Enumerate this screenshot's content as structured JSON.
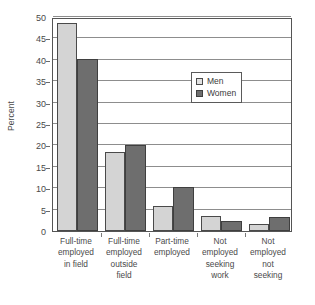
{
  "chart_data": {
    "type": "bar",
    "title": "",
    "subtitle": "",
    "xlabel": "",
    "ylabel": "Percent",
    "ylim": [
      0,
      50
    ],
    "ytick_step": 5,
    "yticks": [
      0,
      5,
      10,
      15,
      20,
      25,
      30,
      35,
      40,
      45,
      50
    ],
    "ytick_labels": [
      "0",
      "5",
      "10",
      "15",
      "20",
      "25",
      "30",
      "35",
      "40",
      "45",
      "50"
    ],
    "grid": true,
    "grid_axis": "y",
    "legend_position": "center-right-inside",
    "categories": [
      "Full-time employed in field",
      "Full-time employed outside field",
      "Part-time employed",
      "Not employed seeking work",
      "Not employed not seeking"
    ],
    "category_lines": [
      [
        "Full-time",
        "employed",
        "in field"
      ],
      [
        "Full-time",
        "employed",
        "outside",
        "field"
      ],
      [
        "Part-time",
        "employed"
      ],
      [
        "Not",
        "employed",
        "seeking",
        "work"
      ],
      [
        "Not",
        "employed",
        "not",
        "seeking"
      ]
    ],
    "series": [
      {
        "name": "Men",
        "color": "#d4d4d4",
        "values": [
          48.7,
          18.5,
          5.8,
          3.5,
          1.7
        ]
      },
      {
        "name": "Women",
        "color": "#6e6e6e",
        "values": [
          40.2,
          20.0,
          10.2,
          2.4,
          3.3
        ]
      }
    ],
    "annotations": []
  },
  "legend": {
    "entries": [
      {
        "label": "Men",
        "swatch": "light-gray-square"
      },
      {
        "label": "Women",
        "swatch": "dark-gray-square"
      }
    ]
  },
  "colors": {
    "men_bar": "#d4d4d4",
    "women_bar": "#6e6e6e",
    "bar_outline": "#4a4a4a",
    "gridline": "#8d8d8d",
    "axis": "#555555",
    "text": "#4a4a4a",
    "background": "#ffffff"
  }
}
